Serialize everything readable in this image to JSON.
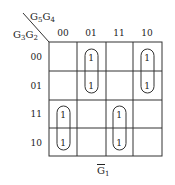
{
  "kmap": {
    "col_variables": {
      "base1": "G",
      "sub1": "5",
      "base2": "G",
      "sub2": "4"
    },
    "row_variables": {
      "base1": "G",
      "sub1": "3",
      "base2": "G",
      "sub2": "2"
    },
    "col_labels": [
      "00",
      "01",
      "11",
      "10"
    ],
    "row_labels": [
      "00",
      "01",
      "11",
      "10"
    ],
    "cells": [
      [
        "",
        "1",
        "",
        "1"
      ],
      [
        "",
        "1",
        "",
        "1"
      ],
      [
        "1",
        "",
        "1",
        ""
      ],
      [
        "1",
        "",
        "1",
        ""
      ]
    ],
    "groupings": [
      {
        "col": 1,
        "rows": [
          0,
          1
        ]
      },
      {
        "col": 3,
        "rows": [
          0,
          1
        ]
      },
      {
        "col": 0,
        "rows": [
          2,
          3
        ]
      },
      {
        "col": 2,
        "rows": [
          2,
          3
        ]
      }
    ],
    "caption": {
      "base": "G",
      "bar": true,
      "sub": "1"
    },
    "colors": {
      "line": "#333333",
      "text": "#222222"
    }
  }
}
